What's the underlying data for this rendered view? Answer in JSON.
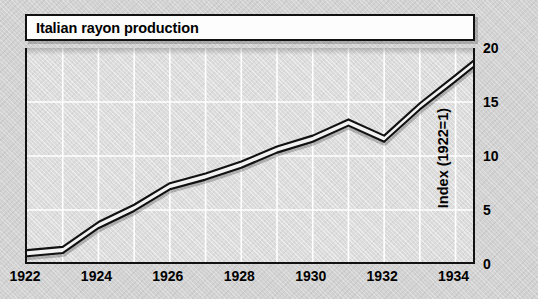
{
  "chart_data": {
    "type": "line",
    "title": "Italian rayon production",
    "xlabel": "",
    "ylabel": "Index (1922=1)",
    "xlim": [
      1922,
      1934.6
    ],
    "ylim": [
      0,
      20
    ],
    "grid": true,
    "legend": "none",
    "x": [
      1922,
      1923,
      1924,
      1925,
      1926,
      1927,
      1928,
      1929,
      1930,
      1931,
      1932,
      1933,
      1934,
      1934.6
    ],
    "values": [
      1.0,
      1.3,
      3.6,
      5.2,
      7.2,
      8.1,
      9.2,
      10.6,
      11.6,
      13.1,
      11.6,
      14.6,
      17.2,
      18.8
    ],
    "xticks": [
      "1922",
      "1924",
      "1926",
      "1928",
      "1930",
      "1932",
      "1934"
    ],
    "xtick_values": [
      1922,
      1924,
      1926,
      1928,
      1930,
      1932,
      1934
    ],
    "yticks": [
      "0",
      "5",
      "10",
      "15",
      "20"
    ],
    "ytick_values": [
      0,
      5,
      10,
      15,
      20
    ],
    "series_name": "Italian rayon production index",
    "line_color": "#111111",
    "band_color": "#ffffff",
    "grid_color": "#ffffff",
    "plot_background": "#dcdcdc",
    "figure_background": "#d2d2d2"
  },
  "axes": {
    "y_axis_position": "right",
    "x_axis_position": "bottom"
  }
}
